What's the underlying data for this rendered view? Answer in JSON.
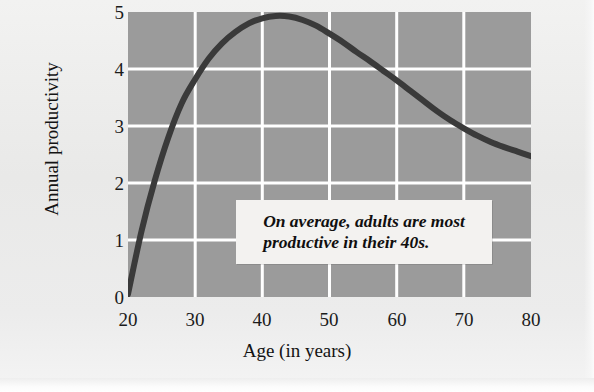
{
  "chart_data": {
    "type": "line",
    "title": "",
    "xlabel": "Age (in years)",
    "ylabel": "Annual productivity",
    "xlim": [
      20,
      80
    ],
    "ylim": [
      0,
      5
    ],
    "xticks": [
      "20",
      "30",
      "40",
      "50",
      "60",
      "70",
      "80"
    ],
    "yticks": [
      "0",
      "1",
      "2",
      "3",
      "4",
      "5"
    ],
    "grid": true,
    "legend": "none",
    "plot_background_color": "#9b9b9b",
    "gridline_color": "#ffffff",
    "line_color": "#3a3a3a",
    "series": [
      {
        "name": "Annual productivity",
        "x": [
          20,
          22,
          24,
          26,
          28,
          30,
          32,
          34,
          36,
          38,
          40,
          42,
          44,
          46,
          48,
          50,
          52,
          54,
          56,
          58,
          60,
          62,
          64,
          66,
          68,
          70,
          72,
          74,
          76,
          78,
          80
        ],
        "values": [
          0.05,
          1.15,
          2.05,
          2.8,
          3.4,
          3.82,
          4.18,
          4.45,
          4.65,
          4.8,
          4.89,
          4.93,
          4.92,
          4.86,
          4.76,
          4.62,
          4.47,
          4.3,
          4.14,
          3.97,
          3.8,
          3.62,
          3.44,
          3.26,
          3.1,
          2.96,
          2.83,
          2.72,
          2.63,
          2.55,
          2.47
        ]
      }
    ],
    "annotations": [
      {
        "text_line_1": "On average, adults are most",
        "text_line_2": "productive in their 40s.",
        "style": "bold-italic-serif",
        "background": "#f3f2f0"
      }
    ]
  }
}
